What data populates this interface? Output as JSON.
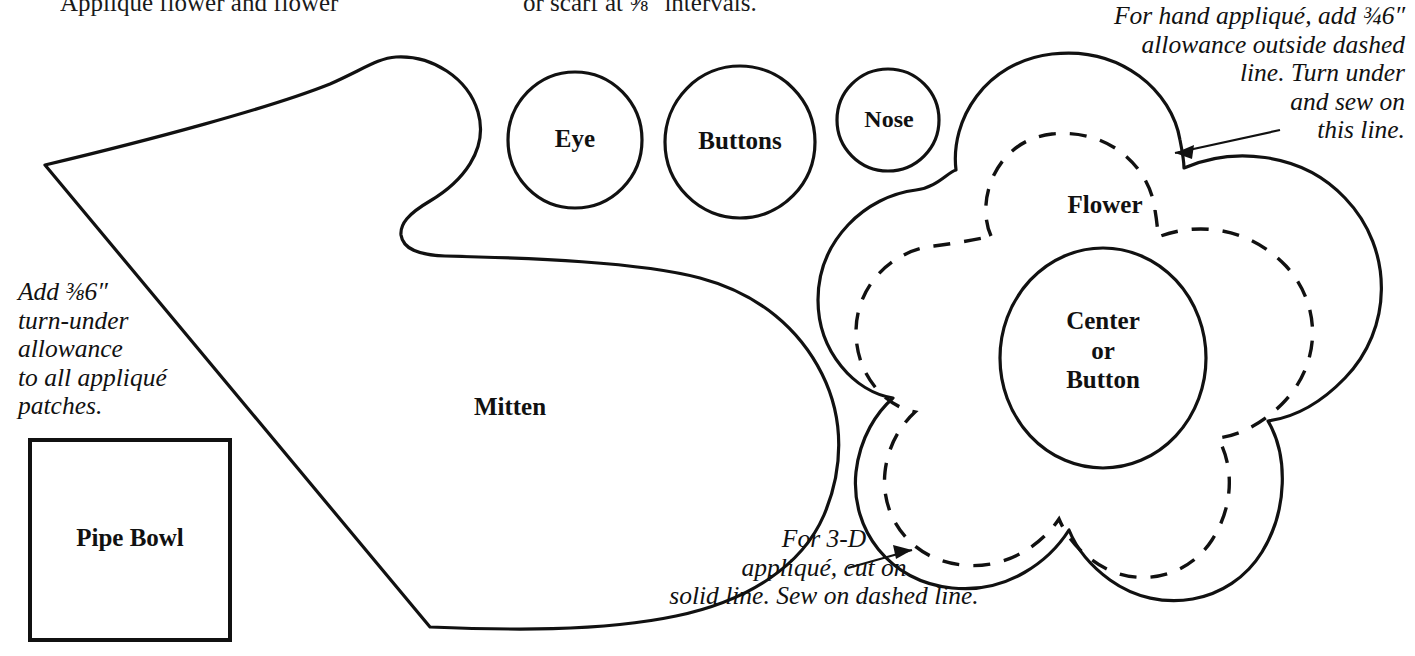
{
  "document": {
    "type": "sewing-pattern-template-sheet",
    "line_color": "#111111",
    "background_color": "#ffffff"
  },
  "clipped_headings": {
    "left": "Appliqué flower and flower",
    "right": "or scarf at ⅝\" intervals."
  },
  "pieces": [
    {
      "id": "mitten",
      "label": "Mitten",
      "shape": "mitten-outline"
    },
    {
      "id": "eye",
      "label": "Eye",
      "shape": "circle"
    },
    {
      "id": "buttons",
      "label": "Buttons",
      "shape": "circle"
    },
    {
      "id": "nose",
      "label": "Nose",
      "shape": "circle"
    },
    {
      "id": "pipe-bowl",
      "label": "Pipe Bowl",
      "shape": "square"
    },
    {
      "id": "flower",
      "label": "Flower",
      "shape": "five-petal-flower"
    },
    {
      "id": "center",
      "label": "Center\nor\nButton",
      "shape": "circle"
    }
  ],
  "labels": {
    "eye": "Eye",
    "buttons": "Buttons",
    "nose": "Nose",
    "mitten": "Mitten",
    "pipe_bowl": "Pipe Bowl",
    "flower": "Flower",
    "center_or_button": "Center\nor\nButton"
  },
  "notes": {
    "left_turn_under": "Add ⅜6″\nturn-under\nallowance\nto all appliqué\npatches.",
    "left_turn_under_plain": "Add 3/16\" turn-under allowance to all appliqué patches.",
    "right_hand_applique": "For hand appliqué, add ¾6″\nallowance outside dashed\nline. Turn under\nand sew on\nthis line.",
    "right_hand_applique_plain": "For hand appliqué, add 3/16\" allowance outside dashed line. Turn under and sew on this line.",
    "three_d_applique": "For 3-D\nappliqué, cut on\nsolid line. Sew on dashed line.",
    "three_d_applique_plain": "For 3-D appliqué, cut on solid line. Sew on dashed line."
  },
  "measurements": {
    "turn_under_allowance": "3/16\"",
    "interval_spacing": "5/8\""
  },
  "annotations": [
    {
      "id": "arrow-to-dashed-line",
      "name": "leader-arrow",
      "points_to": "flower dashed stitch line"
    },
    {
      "id": "arrow-to-solid-line",
      "name": "leader-arrow",
      "points_to": "flower solid cut line"
    }
  ]
}
